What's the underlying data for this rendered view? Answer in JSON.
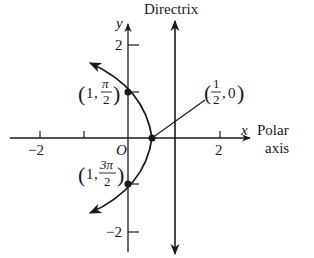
{
  "diagram": {
    "type": "polar-conic-parabola",
    "title_label": "Directrix",
    "axes": {
      "x_label": "x",
      "y_label": "y",
      "polar_axis_label_line1": "Polar",
      "polar_axis_label_line2": "axis",
      "origin_label": "O",
      "x_ticks": [
        "−2",
        "2"
      ],
      "y_ticks": [
        "2",
        "−2"
      ]
    },
    "points": [
      {
        "label": "(1, π/2)",
        "r": "1",
        "theta_num": "π",
        "theta_den": "2"
      },
      {
        "label": "(1, 3π/2)",
        "r": "1",
        "theta_num": "3π",
        "theta_den": "2"
      },
      {
        "label": "(1/2, 0)",
        "r_num": "1",
        "r_den": "2",
        "theta": "0"
      }
    ],
    "colors": {
      "stroke": "#1a1a1a",
      "background": "#ffffff"
    }
  }
}
